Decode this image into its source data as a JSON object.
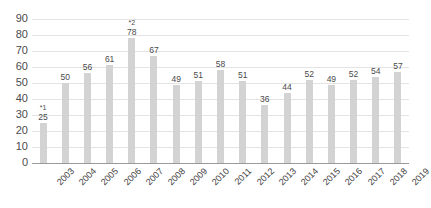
{
  "chart_data": {
    "type": "bar",
    "title": "",
    "subtitle": "",
    "xlabel": "",
    "ylabel": "",
    "ylim": [
      0,
      90
    ],
    "ytick_step": 10,
    "yticks": [
      "0",
      "10",
      "20",
      "30",
      "40",
      "50",
      "60",
      "70",
      "80",
      "90"
    ],
    "grid": "horizontal",
    "legend": "none",
    "categories": [
      "2003",
      "2004",
      "2005",
      "2006",
      "2007",
      "2008",
      "2009",
      "2010",
      "2011",
      "2012",
      "2013",
      "2014",
      "2015",
      "2016",
      "2017",
      "2018",
      "2019"
    ],
    "values": [
      25,
      50,
      56,
      61,
      78,
      67,
      49,
      51,
      58,
      51,
      36,
      44,
      52,
      49,
      52,
      54,
      57
    ],
    "data_labels": [
      "25",
      "50",
      "56",
      "61",
      "78",
      "67",
      "49",
      "51",
      "58",
      "51",
      "36",
      "44",
      "52",
      "49",
      "52",
      "54",
      "57"
    ],
    "annotations": [
      {
        "category": "2003",
        "marker": "*1"
      },
      {
        "category": "2007",
        "marker": "*2"
      }
    ],
    "colors": {
      "bar": "#d3d3d3",
      "grid": "#e3e3e3",
      "axis": "#9a9a9a",
      "label_text": "#4a4a4a",
      "tick_text": "#4d4d4d",
      "background": "#ffffff"
    }
  }
}
